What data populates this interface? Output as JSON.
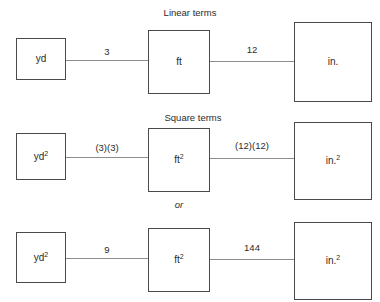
{
  "diagram": {
    "title_row1": "Linear terms",
    "title_row2": "Square terms",
    "separator": "or",
    "rows": [
      {
        "id": "linear",
        "caption": "Linear terms",
        "nodes": [
          {
            "label": "yd",
            "base": "yd",
            "exponent": ""
          },
          {
            "label": "ft",
            "base": "ft",
            "exponent": ""
          },
          {
            "label": "in.",
            "base": "in.",
            "exponent": ""
          }
        ],
        "edges": [
          {
            "label": "3",
            "from": "yd",
            "to": "ft"
          },
          {
            "label": "12",
            "from": "ft",
            "to": "in."
          }
        ]
      },
      {
        "id": "square-factored",
        "caption": "Square terms",
        "nodes": [
          {
            "label": "yd2",
            "base": "yd",
            "exponent": "2"
          },
          {
            "label": "ft2",
            "base": "ft",
            "exponent": "2"
          },
          {
            "label": "in.2",
            "base": "in.",
            "exponent": "2"
          }
        ],
        "edges": [
          {
            "label": "(3)(3)",
            "from": "yd2",
            "to": "ft2"
          },
          {
            "label": "(12)(12)",
            "from": "ft2",
            "to": "in.2"
          }
        ]
      },
      {
        "id": "square-multiplied",
        "caption": "",
        "nodes": [
          {
            "label": "yd2",
            "base": "yd",
            "exponent": "2"
          },
          {
            "label": "ft2",
            "base": "ft",
            "exponent": "2"
          },
          {
            "label": "in.2",
            "base": "in.",
            "exponent": "2"
          }
        ],
        "edges": [
          {
            "label": "9",
            "from": "yd2",
            "to": "ft2"
          },
          {
            "label": "144",
            "from": "ft2",
            "to": "in.2"
          }
        ]
      }
    ],
    "colors": {
      "box_border": "#4a4a4a",
      "connector": "#8d8d8d",
      "text": "#2b2b2b",
      "background": "#ffffff"
    }
  }
}
